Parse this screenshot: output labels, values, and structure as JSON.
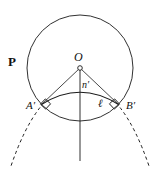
{
  "figure": {
    "kind": "geometry-diagram",
    "width": 159,
    "height": 169,
    "background_color": "#ffffff",
    "stroke_color": "#1a1a1a",
    "labels": {
      "plane": "P",
      "center": "O",
      "normal": "n′",
      "arc_length": "ℓ",
      "point_a": "A′",
      "point_b": "B′"
    },
    "geometry": {
      "circle": {
        "cx": 80,
        "cy": 68,
        "r": 53
      },
      "center_point": {
        "cx": 80,
        "cy": 68,
        "r": 2.2
      },
      "point_a_prime": {
        "x": 41,
        "y": 104
      },
      "point_b_prime": {
        "x": 119,
        "y": 104
      },
      "vertical_axis": {
        "x": 80,
        "y1": 68,
        "y2": 161
      },
      "inner_arc": {
        "from_x": 41,
        "from_y": 104,
        "to_x": 119,
        "to_y": 104,
        "apex_y": 88
      },
      "right_angle_markers": [
        {
          "x": 45,
          "y": 105
        },
        {
          "x": 115,
          "y": 105
        }
      ],
      "dashed_arc_left": {
        "from_x": 41,
        "from_y": 106,
        "to_x": 10,
        "to_y": 166
      },
      "dashed_arc_right": {
        "from_x": 119,
        "from_y": 106,
        "to_x": 150,
        "to_y": 166
      }
    }
  }
}
